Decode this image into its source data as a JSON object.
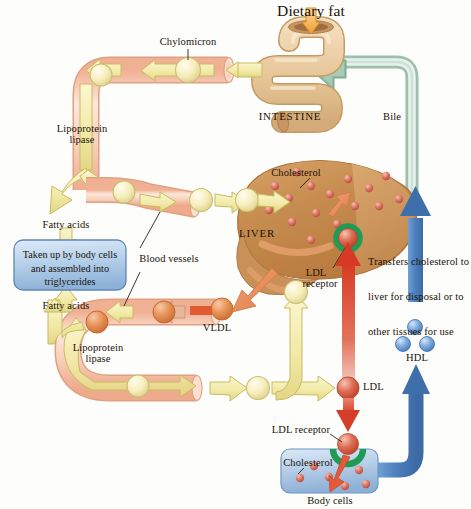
{
  "diagram": {
    "background_color": "#fdfdfb",
    "text_color": "#1a1208"
  },
  "labels": {
    "dietary_fat": "Dietary fat",
    "chylomicron": "Chylomicron",
    "intestine": "INTESTINE",
    "bile": "Bile",
    "lipoprotein_lipase_top_1": "Lipoprotein",
    "lipoprotein_lipase_top_2": "lipase",
    "lipoprotein_lipase_bottom_1": "Lipoprotein",
    "lipoprotein_lipase_bottom_2": "lipase",
    "fatty_acids_upper": "Fatty acids",
    "fatty_acids_lower": "Fatty acids",
    "blood_vessels": "Blood vessels",
    "liver": "LIVER",
    "cholesterol_liver": "Cholesterol",
    "cholesterol_cells": "Cholesterol",
    "ldl_receptor_liver_1": "LDL",
    "ldl_receptor_liver_2": "receptor",
    "ldl_receptor_cells": "LDL receptor",
    "vldl": "VLDL",
    "ldl": "LDL",
    "hdl": "HDL",
    "body_cells": "Body cells"
  },
  "text_boxes": {
    "triglyceride_box": {
      "lines": [
        "Taken up by body cells",
        "and assembled into",
        "triglycerides"
      ],
      "fill_top": "#cfe0f2",
      "fill_bottom": "#8fb5da",
      "border": "#5f86b3"
    },
    "hdl_note": {
      "lines": [
        "Transfers cholesterol to",
        "liver for disposal or to",
        "other tissues for use"
      ]
    }
  },
  "colors": {
    "vessel_outer": "#f6c7ae",
    "vessel_outer_light": "#fde4d6",
    "vessel_stroke": "#e0a183",
    "yellow_arrow": "#f3ecae",
    "yellow_arrow_stroke": "#c9bb5e",
    "yellow_sphere": "#f7f0c0",
    "orange_sphere": "#e08a52",
    "red_sphere": "#d9604a",
    "liver_fill": "#c58a4e",
    "liver_fill_light": "#d9a066",
    "liver_stroke": "#a9703a",
    "cholesterol_dot": "#d4695c",
    "intestine_fill": "#e8c79a",
    "intestine_stroke": "#c49a63",
    "bile_green": "#b9d6c4",
    "bile_stroke": "#8dae9b",
    "red_arrow": "#d8402c",
    "blue_arrow": "#4b7fc0",
    "hdl_blue": "#6ea0d8",
    "receptor_green": "#1f9b55",
    "dietary_arrow": "#f2a13c",
    "orange_arrow": "#e8855a"
  },
  "nodes": [
    {
      "name": "dietary-fat-arrow",
      "type": "arrow",
      "color": "#f2a13c",
      "direction": "down"
    },
    {
      "name": "intestine",
      "type": "organ"
    },
    {
      "name": "bile-duct",
      "type": "tube",
      "color": "#b9d6c4"
    },
    {
      "name": "chylomicron-sphere",
      "type": "particle",
      "color": "#f7f0c0"
    },
    {
      "name": "liver",
      "type": "organ"
    },
    {
      "name": "vldl-sphere",
      "type": "particle",
      "color": "#e08a52"
    },
    {
      "name": "ldl-sphere",
      "type": "particle",
      "color": "#d9604a"
    },
    {
      "name": "hdl-spheres",
      "type": "particle-group",
      "count": 3,
      "color": "#6ea0d8"
    },
    {
      "name": "body-cells-box",
      "type": "cell"
    }
  ],
  "flow": [
    {
      "from": "Dietary fat",
      "to": "INTESTINE"
    },
    {
      "from": "INTESTINE",
      "to": "Chylomicron"
    },
    {
      "from": "Chylomicron",
      "to": "Lipoprotein lipase"
    },
    {
      "from": "Lipoprotein lipase",
      "to": "Fatty acids"
    },
    {
      "from": "Fatty acids",
      "to": "Taken up by body cells and assembled into triglycerides"
    },
    {
      "from": "Chylomicron remnant",
      "to": "LIVER"
    },
    {
      "from": "LIVER",
      "to": "VLDL"
    },
    {
      "from": "VLDL",
      "to": "LDL"
    },
    {
      "from": "LDL",
      "to": "Body cells"
    },
    {
      "from": "LDL",
      "to": "LDL receptor"
    },
    {
      "from": "Body cells",
      "to": "HDL"
    },
    {
      "from": "HDL",
      "to": "LIVER"
    },
    {
      "from": "LIVER",
      "to": "Bile"
    },
    {
      "from": "Bile",
      "to": "INTESTINE"
    }
  ]
}
